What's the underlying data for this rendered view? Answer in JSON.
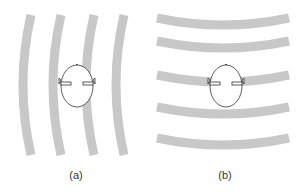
{
  "figure": {
    "panels": [
      {
        "id": "a",
        "label": "(a)",
        "wave_direction": "horizontal propagation (vertical wavefronts)",
        "band_count": 4
      },
      {
        "id": "b",
        "label": "(b)",
        "wave_direction": "vertical propagation (horizontal wavefronts)",
        "band_count": 5
      }
    ],
    "colors": {
      "band": "#c8c8c8",
      "head_outline": "#333333",
      "background": "#ffffff"
    }
  }
}
